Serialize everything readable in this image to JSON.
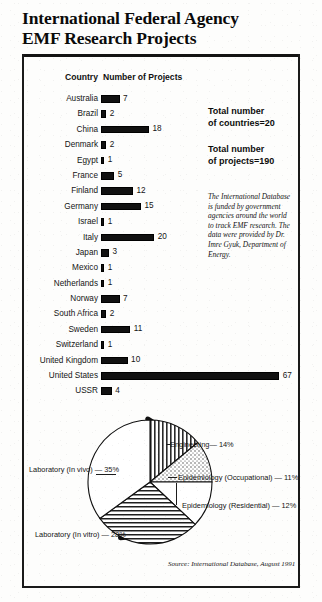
{
  "title": {
    "line1": "International Federal Agency",
    "line2": "EMF Research Projects"
  },
  "columns": {
    "country": "Country",
    "projects": "Number of Projects"
  },
  "totals": {
    "countries_line1": "Total number",
    "countries_line2": "of countries=20",
    "projects_line1": "Total number",
    "projects_line2": "of projects=190"
  },
  "blurb": "The International Database is funded by government agencies around the world to track EMF research. The data were provided by Dr. Imre Gyuk, Department of Energy.",
  "source": "Source: International Database, August 1991",
  "chart_data": [
    {
      "type": "bar",
      "title": "International Federal Agency EMF Research Projects",
      "xlabel": "Number of Projects",
      "ylabel": "Country",
      "orientation": "horizontal",
      "xlim": [
        0,
        67
      ],
      "grid": false,
      "categories": [
        "Australia",
        "Brazil",
        "China",
        "Denmark",
        "Egypt",
        "France",
        "Finland",
        "Germany",
        "Israel",
        "Italy",
        "Japan",
        "Mexico",
        "Netherlands",
        "Norway",
        "South Africa",
        "Sweden",
        "Switzerland",
        "United Kingdom",
        "United States",
        "USSR"
      ],
      "values": [
        7,
        2,
        18,
        2,
        1,
        5,
        12,
        15,
        1,
        20,
        3,
        1,
        1,
        7,
        2,
        11,
        1,
        10,
        67,
        4
      ],
      "total_countries": 20,
      "total_projects": 190
    },
    {
      "type": "pie",
      "title": "",
      "legend_position": "callout-labels",
      "labels": [
        "Engineering",
        "Epidemiology (Occupational)",
        "Epidemiology (Residential)",
        "Laboratory (In vitro)",
        "Laboratory (In vivo)"
      ],
      "values": [
        14,
        11,
        12,
        28,
        35
      ],
      "display_labels": [
        "Engineering— 14%",
        "Epidemiology (Occupational) — 11%",
        "Epidemiology (Residential) — 12%",
        "Laboratory (In vitro) — 28%",
        "Laboratory (In vivo) — 35%"
      ]
    }
  ]
}
